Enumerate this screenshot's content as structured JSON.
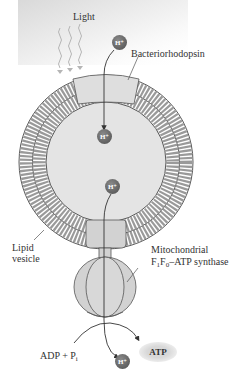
{
  "labels": {
    "light": "Light",
    "bacteriorhodopsin": "Bacteriorhodopsin",
    "lipid_vesicle_line1": "Lipid",
    "lipid_vesicle_line2": "vesicle",
    "mito_line1": "Mitochondrial",
    "mito_f": "F",
    "mito_f1_sub": "1",
    "mito_f0_sub": "0",
    "mito_rest": "–ATP synthase",
    "adp_pi": "ADP + P",
    "pi_sub": "i",
    "atp": "ATP"
  },
  "protons": [
    {
      "id": "outside",
      "label": "H⁺"
    },
    {
      "id": "inside-top",
      "label": "H⁺"
    },
    {
      "id": "inside-bottom",
      "label": "H⁺"
    },
    {
      "id": "released",
      "label": "H⁺"
    }
  ],
  "colors": {
    "membrane": "#6e6e6e",
    "protein": "#d2d2d2",
    "interior": "#e6e6e6",
    "proton": "#555555"
  }
}
